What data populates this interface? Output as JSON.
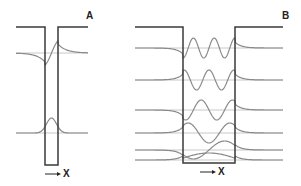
{
  "figure": {
    "width": 301,
    "height": 186,
    "colors": {
      "well": "#3a3a3a",
      "baseline": "#c8c8c8",
      "wave": "#8a8a8a",
      "text": "#222222"
    }
  },
  "panels": [
    {
      "id": "A",
      "label": "A",
      "label_pos": [
        86,
        10
      ],
      "description": "Narrow potential well with two bound states",
      "well": {
        "x_start": 16,
        "x_left": 45,
        "x_right": 58,
        "x_end": 88,
        "y_top": 27,
        "y_bottom": 165
      },
      "axis": {
        "label": "X",
        "arrow_x1": 45,
        "arrow_x2": 61,
        "arrow_y": 174,
        "label_pos": [
          63,
          168
        ]
      },
      "states": [
        {
          "name": "excited-state",
          "baseline": 53,
          "type": "odd",
          "amp": 12
        },
        {
          "name": "ground-state",
          "baseline": 133,
          "type": "even",
          "amp": 15
        }
      ]
    },
    {
      "id": "B",
      "label": "B",
      "label_pos": [
        282,
        10
      ],
      "description": "Wide potential well with six bound states",
      "well": {
        "x_start": 135,
        "x_left": 183,
        "x_right": 235,
        "x_end": 283,
        "y_top": 27,
        "y_bottom": 163
      },
      "axis": {
        "label": "X",
        "arrow_x1": 200,
        "arrow_x2": 216,
        "arrow_y": 172,
        "label_pos": [
          218,
          166
        ]
      },
      "states": [
        {
          "name": "state-n6",
          "baseline": 48,
          "n": 6,
          "amp": 10
        },
        {
          "name": "state-n5",
          "baseline": 80,
          "n": 5,
          "amp": 10
        },
        {
          "name": "state-n4",
          "baseline": 110,
          "n": 4,
          "amp": 10
        },
        {
          "name": "state-n3",
          "baseline": 133,
          "n": 3,
          "amp": 10
        },
        {
          "name": "state-n2",
          "baseline": 150,
          "n": 2,
          "amp": 9
        },
        {
          "name": "state-n1",
          "baseline": 160,
          "n": 1,
          "amp": 7
        }
      ]
    }
  ]
}
